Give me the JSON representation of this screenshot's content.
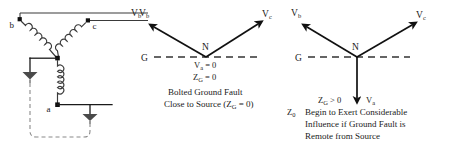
{
  "figure": {
    "background_color": "#ffffff",
    "ink_color": "#1a1a1a"
  },
  "circuit": {
    "name": "wye-connected-source-with-ground-fault",
    "terminals": [
      {
        "id": "b",
        "label": "b"
      },
      {
        "id": "c",
        "label": "c"
      },
      {
        "id": "a",
        "label": "a"
      }
    ],
    "neutral_label": "",
    "ground_symbols": 2,
    "windings": 3,
    "output_label": {
      "text": "V",
      "sub": "b"
    }
  },
  "diagram_middle": {
    "name": "bolted-ground-fault-phasor",
    "phasors": [
      {
        "id": "Vb",
        "text": "V",
        "sub": "b",
        "angle_deg": 150,
        "length": 62
      },
      {
        "id": "Vc",
        "text": "V",
        "sub": "c",
        "angle_deg": 35,
        "length": 68
      }
    ],
    "neutral_label": "N",
    "ground_axis_label": "G",
    "equations": [
      {
        "text": "V",
        "sub": "a",
        "rest": " = 0"
      },
      {
        "text": "Z",
        "sub": "G",
        "rest": " = 0"
      }
    ],
    "caption_lines": [
      "Bolted Ground Fault",
      "Close to Source (Z_G = 0)"
    ],
    "caption_line1": "Bolted Ground Fault",
    "caption_line2_pre": "Close to Source (Z",
    "caption_line2_sub": "G",
    "caption_line2_post": " = 0)"
  },
  "diagram_right": {
    "name": "remote-ground-fault-phasor",
    "phasors": [
      {
        "id": "Vb",
        "text": "V",
        "sub": "b",
        "angle_deg": 150,
        "length": 62
      },
      {
        "id": "Vc",
        "text": "V",
        "sub": "c",
        "angle_deg": 32,
        "length": 68
      },
      {
        "id": "Va",
        "text": "V",
        "sub": "a",
        "angle_deg": 270,
        "length": 48
      }
    ],
    "neutral_label": "N",
    "ground_axis_label": "G",
    "condition_pre": "Z",
    "condition_sub": "G",
    "condition_post": " > 0",
    "va_label": "V",
    "va_sub": "a",
    "z0_label": "Z",
    "z0_sub": "0",
    "caption_lines": [
      "Begin to Exert Considerable",
      "Influence if Ground Fault is",
      "Remote from Source"
    ],
    "caption_line1": "Begin to Exert Considerable",
    "caption_line2": "Influence if Ground Fault is",
    "caption_line3": "Remote from Source"
  }
}
